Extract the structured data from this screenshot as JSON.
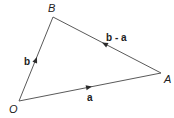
{
  "diagram": {
    "points": {
      "O": {
        "label": "O"
      },
      "A": {
        "label": "A"
      },
      "B": {
        "label": "B"
      }
    },
    "vectors": [
      {
        "id": "a",
        "from": "O",
        "to": "A",
        "label": "a"
      },
      {
        "id": "b",
        "from": "O",
        "to": "B",
        "label": "b"
      },
      {
        "id": "b_minus_a",
        "from": "A",
        "to": "B",
        "label": "b - a"
      }
    ],
    "colors": {
      "line": "#5a5a5a",
      "arrow": "#2b2b2b",
      "text": "#222222"
    }
  }
}
